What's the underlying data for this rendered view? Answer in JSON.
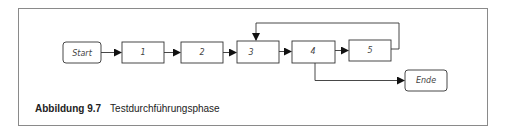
{
  "diagram": {
    "nodes": [
      {
        "id": "start",
        "label": "Start",
        "shape": "rounded"
      },
      {
        "id": "n1",
        "label": "1",
        "shape": "rect"
      },
      {
        "id": "n2",
        "label": "2",
        "shape": "rect"
      },
      {
        "id": "n3",
        "label": "3",
        "shape": "rect"
      },
      {
        "id": "n4",
        "label": "4",
        "shape": "rect"
      },
      {
        "id": "n5",
        "label": "5",
        "shape": "rect"
      },
      {
        "id": "ende",
        "label": "Ende",
        "shape": "rounded"
      }
    ],
    "edges": [
      {
        "from": "start",
        "to": "n1"
      },
      {
        "from": "n1",
        "to": "n2"
      },
      {
        "from": "n2",
        "to": "n3"
      },
      {
        "from": "n3",
        "to": "n4"
      },
      {
        "from": "n4",
        "to": "n5"
      },
      {
        "from": "n5",
        "to": "n3",
        "type": "loop-back"
      },
      {
        "from": "n4",
        "to": "ende",
        "type": "branch"
      }
    ],
    "colors": {
      "stroke": "#333333",
      "arrow": "#111111",
      "frame": "#8a8a8a"
    }
  },
  "caption": {
    "number": "Abbildung 9.7",
    "title": "Testdurchführungsphase"
  }
}
